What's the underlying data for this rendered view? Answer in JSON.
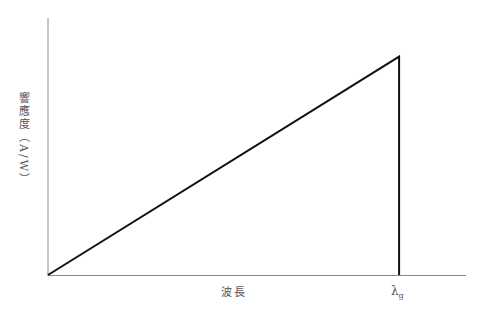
{
  "chart_data": {
    "type": "line",
    "title": "",
    "xlabel": "波長",
    "ylabel": "響應度（A/W）",
    "x_annotation": {
      "symbol": "λ",
      "subscript": "g"
    },
    "series": [
      {
        "name": "responsivity",
        "x": [
          0,
          0.84,
          0.84
        ],
        "values": [
          0,
          0.85,
          0
        ]
      }
    ],
    "xlim": [
      0,
      1
    ],
    "ylim": [
      0,
      1
    ],
    "grid": false,
    "legend": "none"
  },
  "colors": {
    "axis": "#8a8a8a",
    "line": "#111111",
    "text": "#555555"
  }
}
